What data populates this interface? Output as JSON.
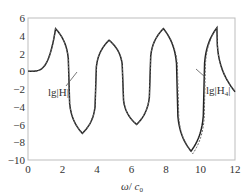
{
  "chart_data": {
    "type": "line",
    "title": "",
    "xlabel": "ω / c₀",
    "ylabel": "",
    "xlim": [
      0,
      12
    ],
    "ylim": [
      -10,
      6
    ],
    "x_ticks": [
      "0",
      "2",
      "4",
      "6",
      "8",
      "10",
      "12"
    ],
    "y_ticks": [
      "6",
      "4",
      "2",
      "0",
      "−2",
      "−4",
      "−6",
      "−8",
      "−10"
    ],
    "grid": false,
    "legend": null,
    "series": [
      {
        "name": "lg|H|",
        "style": "solid",
        "color": "#222222",
        "peaks": [
          {
            "x": 1.6,
            "y": 4.8
          },
          {
            "x": 4.7,
            "y": 3.5
          },
          {
            "x": 7.85,
            "y": 4.8
          },
          {
            "x": 10.95,
            "y": 4.9
          }
        ],
        "troughs": [
          {
            "x": 3.15,
            "y": -7.0
          },
          {
            "x": 6.3,
            "y": -6.0
          },
          {
            "x": 9.45,
            "y": -9.0
          }
        ],
        "start": {
          "x": 0,
          "y": 0
        }
      },
      {
        "name": "lg|H₄|",
        "style": "dashed",
        "color": "#555555",
        "peaks": [
          {
            "x": 1.6,
            "y": 4.8
          },
          {
            "x": 4.7,
            "y": 3.5
          },
          {
            "x": 7.85,
            "y": 4.8
          },
          {
            "x": 10.95,
            "y": 4.9
          }
        ],
        "troughs": [
          {
            "x": 3.15,
            "y": -7.0
          },
          {
            "x": 6.3,
            "y": -6.0
          },
          {
            "x": 9.55,
            "y": -9.3
          }
        ],
        "start": {
          "x": 0,
          "y": 0
        }
      }
    ],
    "annotations": [
      {
        "text": "lg|H|",
        "x": 2.0,
        "y": -4.2,
        "arrow_to": {
          "x": 2.8,
          "y": -2.3
        }
      },
      {
        "text": "lg|H₄|",
        "x": 10.0,
        "y": -3.9,
        "arrow_to": {
          "x": 9.6,
          "y": -2.3
        }
      }
    ]
  },
  "labels": {
    "annot_H": "lg|H|",
    "annot_H4_prefix": "lg|H",
    "annot_H4_sub": "4",
    "annot_H4_suffix": "|",
    "xlabel_omega": "ω",
    "xlabel_slash": "/ ",
    "xlabel_c": "c",
    "xlabel_sub": "0"
  }
}
